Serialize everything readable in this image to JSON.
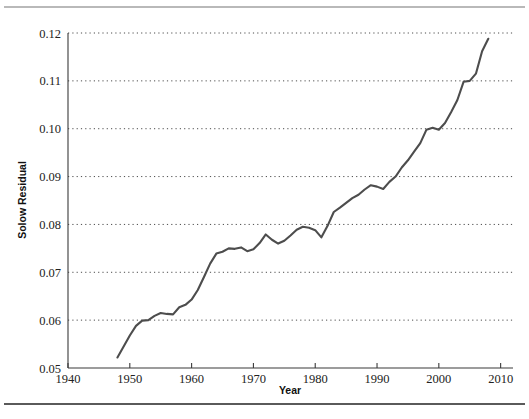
{
  "figure": {
    "background": "#ffffff",
    "line_color": "#4d4d4d",
    "grid_color": "#4d4d4d",
    "axis_color": "#3a3a3a",
    "top_rule_color": "#b9b9b9",
    "bottom_rule_color": "#5a5a5a"
  },
  "chart_data": {
    "type": "line",
    "title": "",
    "xlabel": "Year",
    "ylabel": "Solow Residual",
    "xlim": [
      1940,
      2012
    ],
    "ylim": [
      0.05,
      0.12
    ],
    "grid": true,
    "grid_axis": "y",
    "legend": null,
    "xticks": [
      1940,
      1950,
      1960,
      1970,
      1980,
      1990,
      2000,
      2010
    ],
    "xtick_labels": [
      "1940",
      "1950",
      "1960",
      "1970",
      "1980",
      "1990",
      "2000",
      "2010"
    ],
    "yticks": [
      0.05,
      0.06,
      0.07,
      0.08,
      0.09,
      0.1,
      0.11,
      0.12
    ],
    "ytick_labels": [
      "0.05",
      "0.06",
      "0.07",
      "0.08",
      "0.09",
      "0.10",
      "0.11",
      "0.12"
    ],
    "series": [
      {
        "name": "Solow Residual",
        "color": "#4d4d4d",
        "x": [
          1948,
          1949,
          1950,
          1951,
          1952,
          1953,
          1954,
          1955,
          1956,
          1957,
          1958,
          1959,
          1960,
          1961,
          1962,
          1963,
          1964,
          1965,
          1966,
          1967,
          1968,
          1969,
          1970,
          1971,
          1972,
          1973,
          1974,
          1975,
          1976,
          1977,
          1978,
          1979,
          1980,
          1981,
          1982,
          1983,
          1984,
          1985,
          1986,
          1987,
          1988,
          1989,
          1990,
          1991,
          1992,
          1993,
          1994,
          1995,
          1996,
          1997,
          1998,
          1999,
          2000,
          2001,
          2002,
          2003,
          2004,
          2005,
          2006,
          2007,
          2008
        ],
        "values": [
          0.0522,
          0.0545,
          0.0568,
          0.0588,
          0.0599,
          0.06,
          0.0609,
          0.0615,
          0.0613,
          0.0612,
          0.0627,
          0.0632,
          0.0643,
          0.0663,
          0.069,
          0.0718,
          0.0739,
          0.0743,
          0.075,
          0.0749,
          0.0752,
          0.0744,
          0.0748,
          0.0761,
          0.0779,
          0.0768,
          0.076,
          0.0766,
          0.0777,
          0.0789,
          0.0795,
          0.0793,
          0.0788,
          0.0773,
          0.0797,
          0.0826,
          0.0835,
          0.0845,
          0.0855,
          0.0862,
          0.0873,
          0.0882,
          0.0879,
          0.0874,
          0.0889,
          0.09,
          0.0919,
          0.0934,
          0.0952,
          0.097,
          0.0998,
          0.1002,
          0.0998,
          0.1012,
          0.1035,
          0.106,
          0.1098,
          0.11,
          0.1115,
          0.1162,
          0.1188
        ]
      }
    ]
  },
  "axes": {
    "ylabel_text": "Solow Residual",
    "xlabel_text": "Year"
  }
}
